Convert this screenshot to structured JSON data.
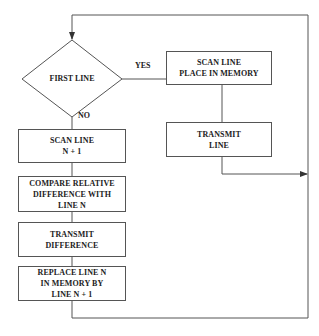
{
  "diagram": {
    "type": "flowchart",
    "decision": {
      "label": "FIRST LINE"
    },
    "branches": {
      "yes": "YES",
      "no": "NO"
    },
    "yes_path": [
      {
        "id": "scan_place",
        "label": "SCAN LINE\nPLACE IN MEMORY"
      },
      {
        "id": "transmit_line",
        "label": "TRANSMIT\nLINE"
      }
    ],
    "no_path": [
      {
        "id": "scan_next",
        "label": "SCAN LINE\nN + 1"
      },
      {
        "id": "compare",
        "label": "COMPARE RELATIVE\nDIFFERENCE WITH\nLINE N"
      },
      {
        "id": "transmit_diff",
        "label": "TRANSMIT\nDIFFERENCE"
      },
      {
        "id": "replace",
        "label": "REPLACE LINE N\nIN MEMORY BY\nLINE N + 1"
      }
    ],
    "colors": {
      "line": "#555555",
      "background": "#ffffff",
      "text": "#222222"
    }
  }
}
